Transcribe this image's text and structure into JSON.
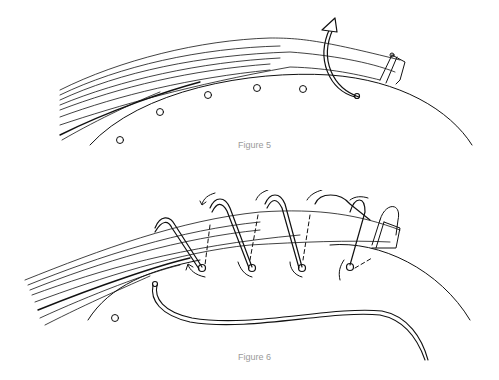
{
  "figures": [
    {
      "id": "figure-5",
      "caption": "Figure 5",
      "description": "Bundle of fibers laid along the rim of a coiled basket, tied at the end, with a holes row and a curved arrow showing the stitching cord wrapping over the bundle",
      "hole_count": 6
    },
    {
      "id": "figure-6",
      "caption": "Figure 6",
      "description": "Cord wrapped in spiral stitches over the fiber bundle, passing through holes in the rim; arrows show the stitching direction; a loose cord end trails below",
      "stitch_count": 5,
      "hole_count": 1
    }
  ],
  "colors": {
    "ink": "#111111",
    "caption": "#9a9a9a",
    "background": "#ffffff"
  }
}
